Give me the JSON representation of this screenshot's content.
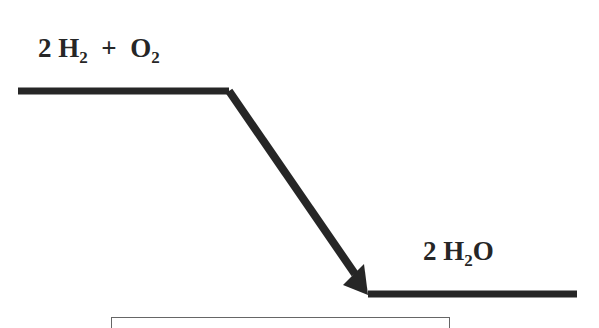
{
  "diagram": {
    "type": "energy-level-diagram",
    "reactants": {
      "coef": "2",
      "species1": "H",
      "species1_sub": "2",
      "plus": "+",
      "species2": "O",
      "species2_sub": "2"
    },
    "products": {
      "coef": "2",
      "species1": "H",
      "species1_sub": "2",
      "species1_tail": "O"
    },
    "colors": {
      "line": "#262626",
      "background": "#ffffff",
      "box_border": "#666666"
    }
  }
}
